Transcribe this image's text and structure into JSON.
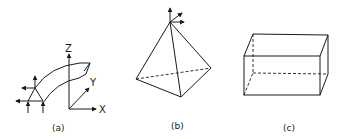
{
  "figures": [
    {
      "id": "a",
      "caption": "(a)",
      "description": "curved beam element with nodal forces and coordinate axes",
      "axes": {
        "x": "X",
        "y": "Y",
        "z": "Z"
      }
    },
    {
      "id": "b",
      "caption": "(b)",
      "description": "tetrahedral solid element with nodal force arrows at apex"
    },
    {
      "id": "c",
      "caption": "(c)",
      "description": "rectangular box (hexahedral) solid element"
    }
  ],
  "colors": {
    "line": "#1a1a1a",
    "background": "#ffffff"
  }
}
